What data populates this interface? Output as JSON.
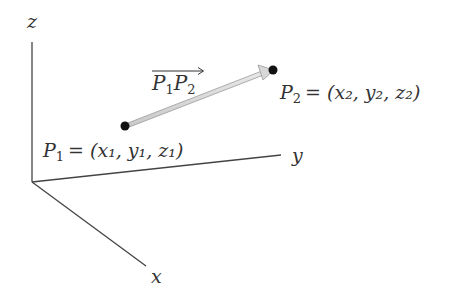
{
  "diagram": {
    "axes": {
      "z_label": "z",
      "y_label": "y",
      "x_label": "x"
    },
    "vector": {
      "label_a": "P",
      "label_a_sub": "1",
      "label_b": "P",
      "label_b_sub": "2",
      "name": "P1P2"
    },
    "points": [
      {
        "id": "P1",
        "name": "P",
        "sub": "1",
        "coords_text": "= (x₁, y₁, z₁)"
      },
      {
        "id": "P2",
        "name": "P",
        "sub": "2",
        "coords_text": "= (x₂, y₂, z₂)"
      }
    ],
    "colors": {
      "axis": "#444444",
      "vector_fill": "#d8d8d8",
      "vector_stroke": "#999999",
      "point": "#111111",
      "text": "#333333"
    }
  }
}
